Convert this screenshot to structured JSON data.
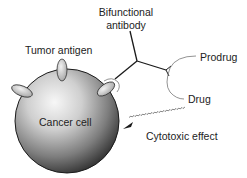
{
  "diagram": {
    "labels": {
      "bifunctional_line1": "Bifunctional",
      "bifunctional_line2": "antibody",
      "tumor_antigen": "Tumor antigen",
      "prodrug": "Prodrug",
      "drug": "Drug",
      "cancer_cell": "Cancer cell",
      "cytotoxic_effect": "Cytotoxic effect"
    },
    "colors": {
      "line": "#1a1a1a",
      "arc": "#777777",
      "text": "#222222",
      "cell_light": "#f4f4f4",
      "cell_dark": "#2a2a2a",
      "antigen": "#e0e0e0"
    },
    "nodes": [
      {
        "id": "cancer-cell",
        "label": "Cancer cell"
      },
      {
        "id": "tumor-antigen",
        "label": "Tumor antigen"
      },
      {
        "id": "bifunctional-antibody",
        "label": "Bifunctional antibody"
      },
      {
        "id": "prodrug",
        "label": "Prodrug"
      },
      {
        "id": "drug",
        "label": "Drug"
      }
    ],
    "edges": [
      {
        "from": "bifunctional-antibody",
        "to": "tumor-antigen",
        "type": "binding"
      },
      {
        "from": "prodrug",
        "to": "drug",
        "type": "conversion"
      },
      {
        "from": "drug",
        "to": "cancer-cell",
        "type": "arrow",
        "label": "Cytotoxic effect"
      }
    ]
  }
}
